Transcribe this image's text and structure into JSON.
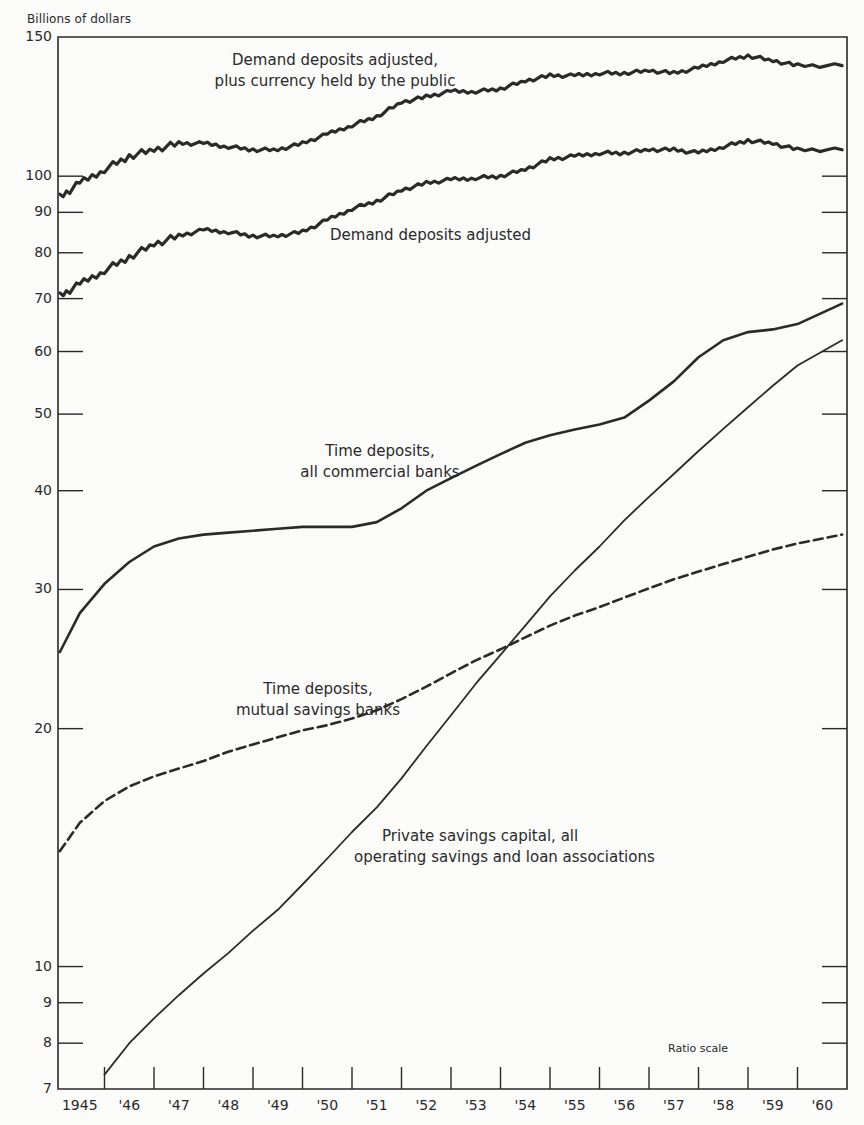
{
  "chart_data": {
    "type": "line",
    "title": "",
    "ylabel": "Billions of dollars",
    "xlabel": "",
    "scale_note": "Ratio scale",
    "y_scale": "log",
    "ylim": [
      7,
      150
    ],
    "xlim": [
      1945,
      1961
    ],
    "grid": false,
    "y_ticks": [
      7,
      8,
      9,
      10,
      20,
      30,
      40,
      50,
      60,
      70,
      80,
      90,
      100,
      150
    ],
    "y_tick_labels": [
      "7",
      "8",
      "9",
      "10",
      "20",
      "30",
      "40",
      "50",
      "60",
      "70",
      "80",
      "90",
      "100",
      "150"
    ],
    "x_tick_labels": [
      "1945",
      "'46",
      "'47",
      "'48",
      "'49",
      "'50",
      "'51",
      "'52",
      "'53",
      "'54",
      "'55",
      "'56",
      "'57",
      "'58",
      "'59",
      "'60"
    ],
    "x": [
      1945.1,
      1945.5,
      1946.0,
      1946.5,
      1947.0,
      1947.5,
      1948.0,
      1948.5,
      1949.0,
      1949.5,
      1950.0,
      1950.5,
      1951.0,
      1951.5,
      1952.0,
      1952.5,
      1953.0,
      1953.5,
      1954.0,
      1954.5,
      1955.0,
      1955.5,
      1956.0,
      1956.5,
      1957.0,
      1957.5,
      1958.0,
      1958.5,
      1959.0,
      1959.5,
      1960.0,
      1960.9
    ],
    "series": [
      {
        "name": "Demand deposits adjusted, plus currency held by the public",
        "style": "solid-thick",
        "values": [
          94,
          98,
          102,
          106,
          108,
          110,
          110,
          109,
          108,
          108,
          110,
          113,
          116,
          119,
          124,
          126,
          128,
          128,
          129,
          132,
          134,
          134,
          135,
          135,
          136,
          135,
          137,
          140,
          142,
          140,
          138,
          138
        ]
      },
      {
        "name": "Demand deposits adjusted",
        "style": "solid-thick",
        "values": [
          70.5,
          73,
          76,
          79,
          82,
          84,
          85.5,
          85,
          84,
          84,
          85,
          88,
          91,
          93,
          96,
          98,
          99,
          99.5,
          100,
          102,
          105,
          106,
          107,
          107,
          108,
          108,
          107,
          109,
          111,
          110,
          108,
          108
        ]
      },
      {
        "name": "Time deposits, all commercial banks",
        "style": "solid",
        "values": [
          25,
          28,
          30.5,
          32.5,
          34,
          34.8,
          35.2,
          35.4,
          35.6,
          35.8,
          36,
          36,
          36,
          36.5,
          38,
          40,
          41.5,
          43,
          44.5,
          46,
          47,
          47.8,
          48.5,
          49.5,
          52,
          55,
          59,
          62,
          63.5,
          64,
          65,
          69
        ]
      },
      {
        "name": "Time deposits, mutual savings banks",
        "style": "dashed",
        "values": [
          14,
          15.2,
          16.2,
          16.9,
          17.4,
          17.8,
          18.2,
          18.7,
          19.1,
          19.5,
          19.9,
          20.2,
          20.6,
          21.1,
          21.8,
          22.6,
          23.5,
          24.4,
          25.2,
          26.1,
          27,
          27.8,
          28.5,
          29.3,
          30.1,
          30.9,
          31.6,
          32.3,
          33,
          33.7,
          34.3,
          35.2
        ]
      },
      {
        "name": "Private savings capital, all operating savings and loan associations",
        "style": "solid-thin",
        "values": [
          null,
          null,
          7.3,
          8.0,
          8.6,
          9.2,
          9.8,
          10.4,
          11.1,
          11.8,
          12.7,
          13.7,
          14.8,
          15.9,
          17.3,
          19.0,
          20.8,
          22.8,
          24.8,
          27.0,
          29.4,
          31.7,
          34.0,
          36.7,
          39.3,
          42.0,
          44.9,
          47.9,
          51.0,
          54.3,
          57.6,
          62.0
        ]
      }
    ],
    "annotations": [
      {
        "text": "Demand deposits adjusted, plus currency held by the public",
        "x": 1951.3,
        "y": 140
      },
      {
        "text": "Demand deposits adjusted",
        "x": 1953.3,
        "y": 82
      },
      {
        "text": "Time deposits, all commercial banks",
        "x": 1951.6,
        "y": 42
      },
      {
        "text": "Time deposits, mutual savings banks",
        "x": 1950.2,
        "y": 21.5
      },
      {
        "text": "Private savings capital, all operating savings and loan associations",
        "x": 1954.7,
        "y": 14.5
      }
    ],
    "crossover": {
      "x": 1954.4,
      "y": 25.5,
      "note": "S&L capital crosses mutual savings deposits"
    }
  },
  "labels": {
    "y_title": "Billions of dollars",
    "ratio_scale": "Ratio scale",
    "annot_m1_line1": "Demand deposits adjusted,",
    "annot_m1_line2": "plus currency held by the public",
    "annot_dd": "Demand deposits adjusted",
    "annot_tdcb_line1": "Time deposits,",
    "annot_tdcb_line2": "all commercial banks",
    "annot_tdms_line1": "Time deposits,",
    "annot_tdms_line2": "mutual savings banks",
    "annot_sl_line1": "Private savings capital, all",
    "annot_sl_line2": "operating savings and loan associations"
  },
  "colors": {
    "ink": "#2a2a2a",
    "paper": "#fbfbfa"
  }
}
